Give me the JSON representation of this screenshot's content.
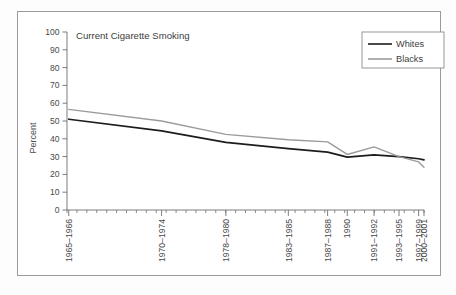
{
  "figure": {
    "frame_border_color": "#9a9a9a",
    "background": "#ffffff"
  },
  "chart_data": {
    "type": "line",
    "title": "Current Cigarette Smoking",
    "xlabel": "",
    "ylabel": "Percent",
    "ylim": [
      0,
      100
    ],
    "yticks": [
      0,
      10,
      20,
      30,
      40,
      50,
      60,
      70,
      80,
      90,
      100
    ],
    "ytick_labels": [
      "0",
      "10",
      "20",
      "30",
      "40",
      "50",
      "60",
      "70",
      "80",
      "90",
      "100"
    ],
    "grid": false,
    "legend_position": "top-right",
    "categories": [
      "1965–1966",
      "1970–1974",
      "1978–1980",
      "1983–1985",
      "1987–1988",
      "1990",
      "1991–1992",
      "1993–1995",
      "1997–1999",
      "2000–2001"
    ],
    "series": [
      {
        "name": "Whites",
        "color": "#1c1c1c",
        "values": [
          51.0,
          44.5,
          38.0,
          34.5,
          32.5,
          29.7,
          31.0,
          30.0,
          28.8,
          28.2
        ]
      },
      {
        "name": "Blacks",
        "color": "#9b9b9b",
        "values": [
          56.5,
          50.0,
          42.5,
          39.5,
          38.3,
          31.2,
          35.5,
          30.0,
          27.0,
          24.0
        ]
      }
    ]
  },
  "legend": {
    "entries": [
      {
        "label": "Whites",
        "color": "#1c1c1c"
      },
      {
        "label": "Blacks",
        "color": "#9b9b9b"
      }
    ]
  }
}
